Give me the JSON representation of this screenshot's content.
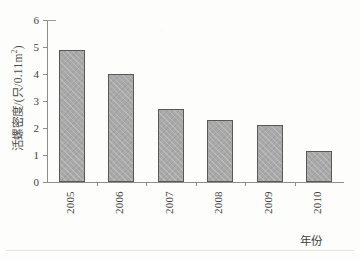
{
  "chart_data": {
    "type": "bar",
    "title": "",
    "subtitle": "",
    "xlabel": "年份",
    "ylabel": "活螺密度/(只/0.11m²)",
    "ylabel_parts": {
      "main": "活螺密度/(只/0.11m",
      "sup": "2",
      "tail": ")"
    },
    "categories": [
      "2005",
      "2006",
      "2007",
      "2008",
      "2009",
      "2010"
    ],
    "values": [
      4.9,
      4.0,
      2.7,
      2.3,
      2.1,
      1.15
    ],
    "series": [
      {
        "name": "活螺密度",
        "values": [
          4.9,
          4.0,
          2.7,
          2.3,
          2.1,
          1.15
        ]
      }
    ],
    "ylim": [
      0,
      6
    ],
    "yticks": [
      "0",
      "1",
      "2",
      "3",
      "4",
      "5",
      "6"
    ],
    "ytick_values": [
      0,
      1,
      2,
      3,
      4,
      5,
      6
    ],
    "grid": false,
    "legend": false,
    "legend_position": "none",
    "bar_color": "#a9a9a9",
    "bar_edge_color": "#585858",
    "axis_color": "#8d8d8d",
    "background_color": "#fdfdfb",
    "xtick_label_rotation": 90
  }
}
